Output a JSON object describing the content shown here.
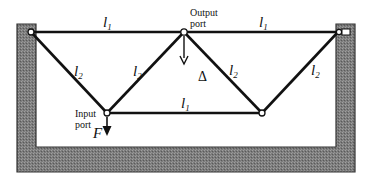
{
  "diagram": {
    "type": "compliant-mechanism-truss",
    "labels": {
      "top_left_member": {
        "base": "l",
        "sub": "1"
      },
      "top_right_member": {
        "base": "l",
        "sub": "1"
      },
      "bottom_member": {
        "base": "l",
        "sub": "1"
      },
      "diag_1": {
        "base": "l",
        "sub": "2"
      },
      "diag_2": {
        "base": "l",
        "sub": "2"
      },
      "diag_3": {
        "base": "l",
        "sub": "2"
      },
      "diag_4": {
        "base": "l",
        "sub": "2"
      },
      "output_displacement": "Δ",
      "input_force": "F",
      "output_port_line1": "Output",
      "output_port_line2": "port",
      "input_port_line1": "Input",
      "input_port_line2": "port"
    },
    "colors": {
      "frame_fill": "#7a7a7a",
      "frame_edge": "#3a3a3a",
      "member": "#111111",
      "background": "#ffffff"
    }
  }
}
